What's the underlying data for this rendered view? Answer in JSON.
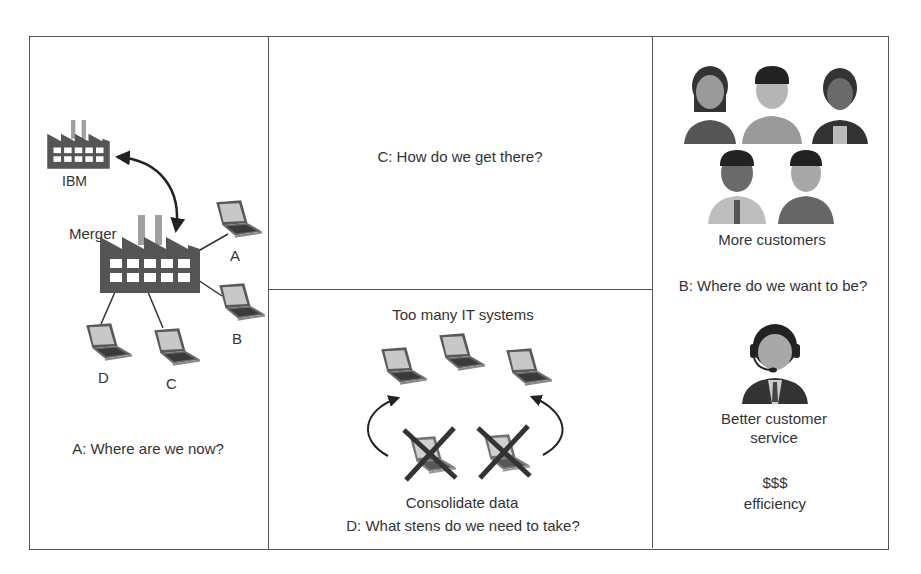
{
  "panels": {
    "a": {
      "caption": "A: Where are we now?",
      "ibm_label": "IBM",
      "merger_label": "Merger",
      "laptops": [
        "A",
        "B",
        "C",
        "D"
      ]
    },
    "b": {
      "caption": "B: Where do we want to be?",
      "more_customers": "More customers",
      "service_line1": "Better customer",
      "service_line2": "service",
      "money": "$$$",
      "efficiency": "efficiency"
    },
    "c": {
      "caption": "C: How do we get there?"
    },
    "d": {
      "title": "Too many IT systems",
      "consolidate": "Consolidate data",
      "caption": "D: What stens do we need to take?"
    }
  },
  "colors": {
    "factory": "#555555",
    "chimney": "#a0a0a0",
    "border": "#555555",
    "text": "#333333"
  }
}
